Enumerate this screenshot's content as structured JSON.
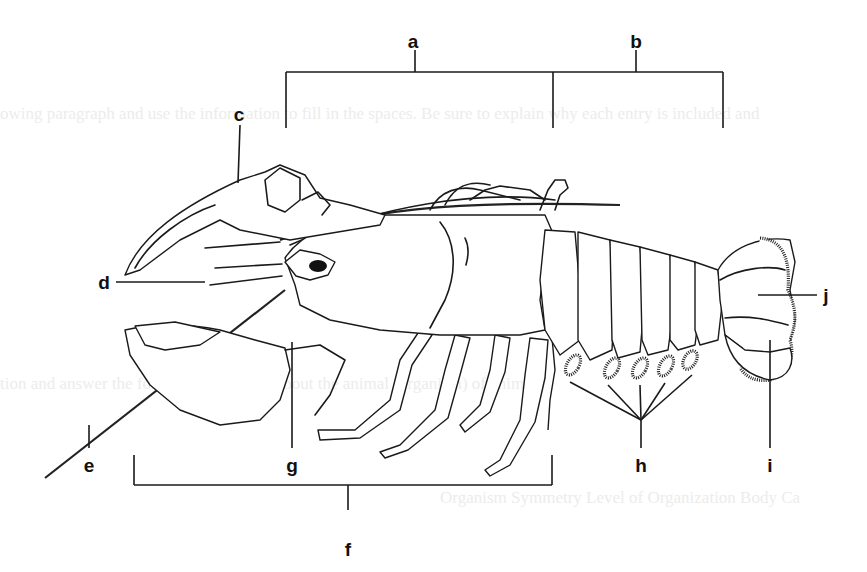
{
  "figure": {
    "background_color": "#ffffff",
    "line_color": "#1a1a1a",
    "ghost_text": [
      "owing paragraph and use the information to fill in the spaces. Be sure to explain why each entry is included and",
      "tion and answer the following questions about the animal (organism) of animal",
      "Organism    Symmetry    Level of Organization    Body Ca"
    ]
  },
  "labels": [
    {
      "id": "a",
      "text": "a",
      "x": 413,
      "y": 32,
      "target": "cephalothorax bracket"
    },
    {
      "id": "b",
      "text": "b",
      "x": 636,
      "y": 32,
      "target": "abdomen bracket"
    },
    {
      "id": "c",
      "text": "c",
      "x": 239,
      "y": 105,
      "target": "cheliped (claw)"
    },
    {
      "id": "d",
      "text": "d",
      "x": 104,
      "y": 275,
      "target": "antennule"
    },
    {
      "id": "e",
      "text": "e",
      "x": 89,
      "y": 456,
      "target": "antenna"
    },
    {
      "id": "f",
      "text": "f",
      "x": 348,
      "y": 540,
      "target": "walking legs bracket"
    },
    {
      "id": "g",
      "text": "g",
      "x": 292,
      "y": 456,
      "target": "mouthparts / maxilliped"
    },
    {
      "id": "h",
      "text": "h",
      "x": 641,
      "y": 456,
      "target": "swimmerets"
    },
    {
      "id": "i",
      "text": "i",
      "x": 770,
      "y": 456,
      "target": "uropod"
    },
    {
      "id": "j",
      "text": "j",
      "x": 826,
      "y": 286,
      "target": "telson"
    }
  ]
}
